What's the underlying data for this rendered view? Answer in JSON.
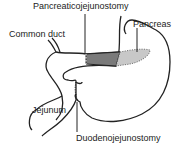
{
  "labels": {
    "pancreaticojejunostomy": "Pancreaticojejunostomy",
    "pancreas": "Pancreas",
    "common_duct": "Common duct",
    "jejunum": "Jejunum",
    "duodenojejunostomy": "Duodenojejunostomy"
  },
  "colors": {
    "anastomosis_fill": "#7a7a7a",
    "pancreas_fill": "#c8c8c8",
    "outline": "#222222"
  }
}
